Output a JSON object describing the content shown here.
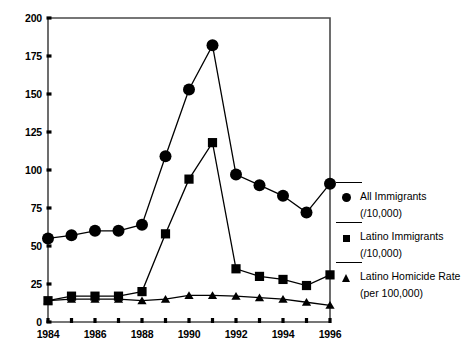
{
  "chart_data": {
    "type": "line",
    "title": "",
    "subtitle": "",
    "xlabel": "",
    "ylabel": "",
    "xlim": [
      1984,
      1996
    ],
    "ylim": [
      0,
      200
    ],
    "yticks": [
      0,
      25,
      50,
      75,
      100,
      125,
      150,
      175,
      200
    ],
    "ytick_labels": [
      "0",
      "25",
      "50",
      "75",
      "100",
      "125",
      "150",
      "175",
      "200"
    ],
    "xticks": [
      1984,
      1985,
      1986,
      1987,
      1988,
      1989,
      1990,
      1991,
      1992,
      1993,
      1994,
      1995,
      1996
    ],
    "xtick_labels": [
      "1984",
      "",
      "1986",
      "",
      "1988",
      "",
      "1990",
      "",
      "1992",
      "",
      "1994",
      "",
      "1996"
    ],
    "x": [
      1984,
      1985,
      1986,
      1987,
      1988,
      1989,
      1990,
      1991,
      1992,
      1993,
      1994,
      1995,
      1996
    ],
    "grid": false,
    "legend_position": "right",
    "series": [
      {
        "name": "All Immigrants",
        "unit": "(/10,000)",
        "marker": "circle",
        "color": "#000000",
        "values": [
          55,
          57,
          60,
          60,
          64,
          109,
          153,
          182,
          97,
          90,
          83,
          72,
          91
        ]
      },
      {
        "name": "Latino Immigrants",
        "unit": "(/10,000)",
        "marker": "square",
        "color": "#000000",
        "values": [
          14,
          17,
          17,
          17,
          20,
          58,
          94,
          118,
          35,
          30,
          28,
          24,
          31
        ]
      },
      {
        "name": "Latino Homicide Rate",
        "unit": "(per 100,000)",
        "marker": "triangle",
        "color": "#000000",
        "values": [
          14,
          15,
          15,
          15,
          14,
          15,
          17.5,
          17.5,
          17,
          16,
          15,
          13,
          11
        ]
      }
    ]
  },
  "legend": {
    "entries": [
      {
        "label": "All Immigrants",
        "sub": "(/10,000)",
        "marker": "circle"
      },
      {
        "label": "Latino Immigrants",
        "sub": "(/10,000)",
        "marker": "square"
      },
      {
        "label": "Latino Homicide Rate",
        "sub": "(per 100,000)",
        "marker": "triangle"
      }
    ]
  }
}
